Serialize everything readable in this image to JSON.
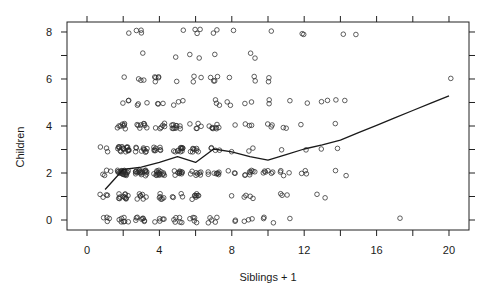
{
  "chart_data": {
    "type": "scatter",
    "title": "",
    "xlabel": "Siblings + 1",
    "ylabel": "Children",
    "xlim": [
      -1.105,
      21.105
    ],
    "ylim": [
      -0.4255,
      8.4255
    ],
    "grid": false,
    "legend": null,
    "jitter": {
      "x": 0.32,
      "y": 0.12
    },
    "x_ticks": [
      0,
      2,
      4,
      6,
      8,
      10,
      12,
      14,
      16,
      18,
      20
    ],
    "x_tick_labels": [
      {
        "value": 0,
        "label": "0"
      },
      {
        "value": 4,
        "label": "4"
      },
      {
        "value": 8,
        "label": "8"
      },
      {
        "value": 12,
        "label": "12"
      },
      {
        "value": 16,
        "label": "16"
      },
      {
        "value": 20,
        "label": "20"
      }
    ],
    "y_ticks": [
      0,
      1,
      2,
      3,
      4,
      5,
      6,
      7,
      8
    ],
    "y_tick_labels": [
      {
        "value": 0,
        "label": "0"
      },
      {
        "value": 2,
        "label": "2"
      },
      {
        "value": 4,
        "label": "4"
      },
      {
        "value": 6,
        "label": "6"
      },
      {
        "value": 8,
        "label": "8"
      }
    ],
    "point_groups_format": [
      "x",
      "y",
      "count"
    ],
    "point_groups": [
      [
        2,
        8,
        1
      ],
      [
        3,
        8,
        3
      ],
      [
        5,
        8,
        1
      ],
      [
        6,
        8,
        3
      ],
      [
        7,
        8,
        2
      ],
      [
        8,
        8,
        1
      ],
      [
        10,
        8,
        1
      ],
      [
        12,
        8,
        2
      ],
      [
        14,
        8,
        1
      ],
      [
        15,
        8,
        1
      ],
      [
        3,
        7,
        1
      ],
      [
        5,
        7,
        1
      ],
      [
        6,
        7,
        2
      ],
      [
        7,
        7,
        1
      ],
      [
        9,
        7,
        2
      ],
      [
        2,
        6,
        1
      ],
      [
        3,
        6,
        3
      ],
      [
        4,
        6,
        5
      ],
      [
        5,
        6,
        1
      ],
      [
        6,
        6,
        3
      ],
      [
        7,
        6,
        4
      ],
      [
        8,
        6,
        1
      ],
      [
        9,
        6,
        2
      ],
      [
        10,
        6,
        2
      ],
      [
        20,
        6,
        1
      ],
      [
        2,
        5,
        3
      ],
      [
        3,
        5,
        3
      ],
      [
        4,
        5,
        3
      ],
      [
        5,
        5,
        3
      ],
      [
        7,
        5,
        3
      ],
      [
        8,
        5,
        2
      ],
      [
        9,
        5,
        2
      ],
      [
        10,
        5,
        2
      ],
      [
        11,
        5,
        1
      ],
      [
        12,
        5,
        1
      ],
      [
        13,
        5,
        2
      ],
      [
        14,
        5,
        2
      ],
      [
        2,
        4,
        8
      ],
      [
        3,
        4,
        8
      ],
      [
        4,
        4,
        6
      ],
      [
        5,
        4,
        10
      ],
      [
        6,
        4,
        5
      ],
      [
        7,
        4,
        8
      ],
      [
        8,
        4,
        1
      ],
      [
        9,
        4,
        3
      ],
      [
        10,
        4,
        3
      ],
      [
        11,
        4,
        2
      ],
      [
        12,
        4,
        1
      ],
      [
        14,
        4,
        1
      ],
      [
        1,
        3,
        3
      ],
      [
        2,
        3,
        18
      ],
      [
        3,
        3,
        10
      ],
      [
        4,
        3,
        8
      ],
      [
        5,
        3,
        12
      ],
      [
        6,
        3,
        8
      ],
      [
        7,
        3,
        4
      ],
      [
        8,
        3,
        1
      ],
      [
        9,
        3,
        2
      ],
      [
        11,
        3,
        1
      ],
      [
        12,
        3,
        1
      ],
      [
        13,
        3,
        1
      ],
      [
        14,
        3,
        1
      ],
      [
        1,
        2,
        4
      ],
      [
        2,
        2,
        25
      ],
      [
        3,
        2,
        20
      ],
      [
        4,
        2,
        16
      ],
      [
        5,
        2,
        10
      ],
      [
        6,
        2,
        8
      ],
      [
        7,
        2,
        8
      ],
      [
        8,
        2,
        3
      ],
      [
        9,
        2,
        8
      ],
      [
        10,
        2,
        6
      ],
      [
        11,
        2,
        4
      ],
      [
        12,
        2,
        3
      ],
      [
        14,
        2,
        2
      ],
      [
        1,
        1,
        4
      ],
      [
        2,
        1,
        12
      ],
      [
        3,
        1,
        7
      ],
      [
        4,
        1,
        6
      ],
      [
        5,
        1,
        4
      ],
      [
        6,
        1,
        8
      ],
      [
        8,
        1,
        1
      ],
      [
        9,
        1,
        4
      ],
      [
        11,
        1,
        3
      ],
      [
        13,
        1,
        2
      ],
      [
        1,
        0,
        4
      ],
      [
        2,
        0,
        7
      ],
      [
        3,
        0,
        8
      ],
      [
        4,
        0,
        5
      ],
      [
        5,
        0,
        6
      ],
      [
        6,
        0,
        5
      ],
      [
        7,
        0,
        5
      ],
      [
        8,
        0,
        2
      ],
      [
        9,
        0,
        3
      ],
      [
        10,
        0,
        3
      ],
      [
        11,
        0,
        1
      ],
      [
        17,
        0,
        1
      ]
    ],
    "smoother_line": {
      "name": "smooth fit",
      "x": [
        1,
        2,
        3,
        4,
        5,
        6,
        7,
        8,
        9,
        10,
        11,
        12,
        13,
        14,
        15,
        16,
        17,
        18,
        19,
        20
      ],
      "y": [
        1.3,
        2.15,
        2.25,
        2.45,
        2.7,
        2.45,
        3.02,
        2.9,
        2.7,
        2.55,
        2.78,
        3.02,
        3.2,
        3.4,
        3.72,
        4.03,
        4.35,
        4.66,
        4.97,
        5.28
      ]
    }
  }
}
